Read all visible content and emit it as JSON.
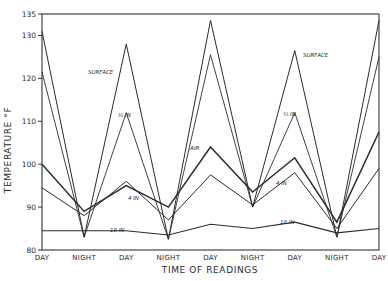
{
  "chart_data": {
    "type": "line",
    "title": "",
    "xlabel": "Time of Readings",
    "ylabel": "Temperature °F",
    "ylim": [
      80,
      135
    ],
    "yticks": [
      80,
      90,
      100,
      110,
      120,
      130,
      135
    ],
    "grid": false,
    "legend": "inline annotations",
    "categories": [
      "DAY",
      "NIGHT",
      "DAY",
      "NIGHT",
      "DAY",
      "NIGHT",
      "DAY",
      "NIGHT",
      "DAY"
    ],
    "series": [
      {
        "name": "SURFACE",
        "values": [
          131,
          83,
          128,
          82.5,
          133.5,
          90,
          126.5,
          83,
          133.5
        ]
      },
      {
        "name": "1/2 IN",
        "values": [
          121.5,
          83,
          112,
          82.5,
          125.5,
          90,
          112,
          83,
          125
        ]
      },
      {
        "name": "AIR",
        "values": [
          100,
          89,
          95,
          90,
          104,
          93.5,
          101.5,
          86.5,
          107.5
        ]
      },
      {
        "name": "4 IN",
        "values": [
          94.5,
          88,
          96,
          87,
          97.5,
          90.5,
          98,
          85,
          99
        ]
      },
      {
        "name": "18 IN",
        "values": [
          84.5,
          84.5,
          84.5,
          83.5,
          86,
          85,
          86.5,
          84,
          85
        ]
      }
    ],
    "annotations": [
      {
        "text": "SURFACE",
        "near": "DAY 2"
      },
      {
        "text": "½ IN",
        "near": "DAY 2"
      },
      {
        "text": "4 IN",
        "near": "DAY 2"
      },
      {
        "text": "18 IN",
        "near": "NIGHT 1–DAY 2"
      },
      {
        "text": "AIR",
        "near": "DAY 3"
      },
      {
        "text": "SURFACE",
        "near": "DAY 4"
      },
      {
        "text": "½ IN",
        "near": "DAY 4"
      },
      {
        "text": "4 IN",
        "near": "DAY 4"
      },
      {
        "text": "18 IN",
        "near": "NIGHT 3–DAY 4"
      }
    ]
  },
  "labels": {
    "xlabel": "Time of Readings",
    "ylabel": "Temperature °F"
  }
}
